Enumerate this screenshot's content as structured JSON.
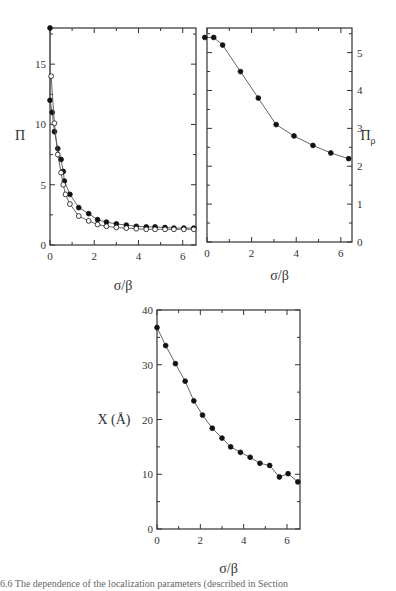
{
  "chart_data": [
    {
      "id": "panel-a",
      "type": "line",
      "title": "",
      "xlabel": "σ/β",
      "ylabel": "Π",
      "xlim": [
        0,
        6.6
      ],
      "ylim": [
        0,
        18
      ],
      "xticks": [
        0,
        2,
        4,
        6
      ],
      "yticks": [
        0,
        5,
        10,
        15
      ],
      "grid": false,
      "legend": null,
      "series": [
        {
          "name": "filled",
          "marker": "filled-circle",
          "x": [
            0,
            0,
            0.1,
            0.2,
            0.35,
            0.5,
            0.6,
            0.65,
            0.9,
            1.3,
            1.75,
            2.15,
            2.55,
            3.0,
            3.45,
            3.9,
            4.35,
            4.75,
            5.2,
            5.6,
            6.05,
            6.5
          ],
          "y": [
            18,
            12,
            11,
            9.4,
            8,
            7.1,
            6.1,
            5.3,
            4.2,
            3.1,
            2.6,
            2.1,
            1.9,
            1.75,
            1.65,
            1.55,
            1.5,
            1.5,
            1.45,
            1.4,
            1.4,
            1.4
          ]
        },
        {
          "name": "open",
          "marker": "open-circle",
          "x": [
            0.05,
            0.2,
            0.35,
            0.5,
            0.6,
            0.7,
            0.9,
            1.3,
            1.75,
            2.15,
            2.55,
            3.0,
            3.45,
            3.9,
            4.35,
            4.75,
            5.2,
            5.6,
            6.05,
            6.5
          ],
          "y": [
            14,
            10.1,
            7.5,
            6,
            5,
            4.2,
            3.4,
            2.4,
            2.0,
            1.7,
            1.55,
            1.45,
            1.4,
            1.35,
            1.3,
            1.3,
            1.3,
            1.3,
            1.3,
            1.3
          ]
        }
      ]
    },
    {
      "id": "panel-b",
      "type": "line",
      "title": "",
      "xlabel": "σ/β",
      "ylabel": "Π_ρ",
      "ylabel_position": "right",
      "xlim": [
        0,
        6.5
      ],
      "ylim": [
        0,
        5.65
      ],
      "xticks": [
        0,
        2,
        4,
        6
      ],
      "yticks": [
        0,
        1,
        2,
        3,
        4,
        5
      ],
      "grid": false,
      "legend": null,
      "series": [
        {
          "name": "Π_ρ",
          "marker": "filled-circle",
          "x": [
            -0.1,
            0.3,
            0.7,
            1.5,
            2.3,
            3.1,
            3.9,
            4.75,
            5.55,
            6.35
          ],
          "y": [
            5.4,
            5.4,
            5.2,
            4.5,
            3.8,
            3.1,
            2.8,
            2.55,
            2.35,
            2.2
          ]
        }
      ]
    },
    {
      "id": "panel-c",
      "type": "line",
      "title": "",
      "xlabel": "σ/β",
      "ylabel": "X (Å)",
      "xlim": [
        0,
        6.6
      ],
      "ylim": [
        0,
        40
      ],
      "xticks": [
        0,
        2,
        4,
        6
      ],
      "yticks": [
        0,
        10,
        20,
        30,
        40
      ],
      "grid": false,
      "legend": null,
      "series": [
        {
          "name": "X",
          "marker": "filled-circle",
          "x": [
            0,
            0.4,
            0.85,
            1.3,
            1.7,
            2.1,
            2.55,
            3.0,
            3.4,
            3.85,
            4.3,
            4.75,
            5.2,
            5.65,
            6.05,
            6.5
          ],
          "y": [
            36.8,
            33.5,
            30.2,
            27,
            23.4,
            20.8,
            18.4,
            16.6,
            15,
            14,
            13.1,
            12,
            11.6,
            9.5,
            10.1,
            8.6
          ]
        }
      ]
    }
  ],
  "caption": {
    "text": "6.6   The dependence of the localization parameters (described in Section"
  }
}
